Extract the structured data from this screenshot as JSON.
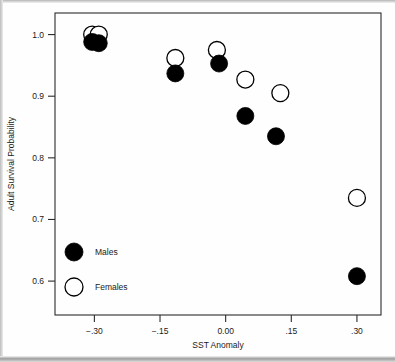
{
  "chart_data": {
    "type": "scatter",
    "title": "",
    "xlabel": "SST Anomaly",
    "ylabel": "Adult Survival Probability",
    "xlim": [
      -0.39,
      0.355
    ],
    "ylim": [
      0.545,
      1.035
    ],
    "grid": false,
    "legend_position": "inside-lower-left",
    "xticks": [
      -0.3,
      -0.15,
      0.0,
      0.15,
      0.3
    ],
    "xticklabels": [
      "−.30",
      "−.15",
      "0.00",
      ".15",
      ".30"
    ],
    "yticks": [
      0.6,
      0.7,
      0.8,
      0.9,
      1.0
    ],
    "yticklabels": [
      "0.6",
      "0.7",
      "0.8",
      "0.9",
      "1.0"
    ],
    "series": [
      {
        "name": "Males",
        "marker": "filled-circle",
        "color": "#000000",
        "points": [
          {
            "x": -0.305,
            "y": 0.988
          },
          {
            "x": -0.29,
            "y": 0.986
          },
          {
            "x": -0.115,
            "y": 0.937
          },
          {
            "x": -0.015,
            "y": 0.953
          },
          {
            "x": 0.045,
            "y": 0.868
          },
          {
            "x": 0.115,
            "y": 0.835
          },
          {
            "x": 0.3,
            "y": 0.608
          }
        ]
      },
      {
        "name": "Females",
        "marker": "open-circle",
        "color": "#ffffff",
        "points": [
          {
            "x": -0.305,
            "y": 1.0
          },
          {
            "x": -0.29,
            "y": 1.0
          },
          {
            "x": -0.115,
            "y": 0.962
          },
          {
            "x": -0.02,
            "y": 0.975
          },
          {
            "x": 0.045,
            "y": 0.927
          },
          {
            "x": 0.125,
            "y": 0.905
          },
          {
            "x": 0.3,
            "y": 0.735
          }
        ]
      }
    ]
  },
  "legend": {
    "entries": [
      {
        "label": "Males",
        "marker": "filled-circle"
      },
      {
        "label": "Females",
        "marker": "open-circle"
      }
    ]
  },
  "axes": {
    "x_title": "SST Anomaly",
    "y_title": "Adult Survival Probability",
    "x_tick_labels": [
      "−.30",
      "−.15",
      "0.00",
      ".15",
      ".30"
    ],
    "y_tick_labels": [
      "0.6",
      "0.7",
      "0.8",
      "0.9",
      "1.0"
    ]
  },
  "colors": {
    "male_marker": "#000000",
    "female_marker": "#ffffff",
    "axis": "#2b2b2b",
    "background": "#ffffff"
  }
}
